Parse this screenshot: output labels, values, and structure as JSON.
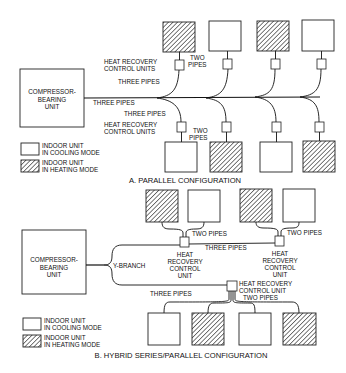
{
  "diagram_a": {
    "caption": "A. PARALLEL CONFIGURATION",
    "compressor": [
      "COMPRESSOR-",
      "BEARING",
      "UNIT"
    ],
    "labels": {
      "hr_top": [
        "HEAT RECOVERY",
        "CONTROL UNITS"
      ],
      "hr_bottom": [
        "HEAT RECOVERY",
        "CONTROL UNITS"
      ],
      "two_pipes_top": [
        "TWO",
        "PIPES"
      ],
      "two_pipes_bottom": [
        "TWO",
        "PIPES"
      ],
      "three_pipes_top": "THREE PIPES",
      "three_pipes_main": "THREE PIPES",
      "three_pipes_bottom": "THREE PIPES"
    },
    "top_units": [
      "heating",
      "cooling",
      "heating",
      "cooling"
    ],
    "bottom_units": [
      "cooling",
      "heating",
      "cooling",
      "heating"
    ],
    "legend": {
      "cooling": [
        "INDOOR UNIT",
        "IN COOLING MODE"
      ],
      "heating": [
        "INDOOR UNIT",
        "IN HEATING MODE"
      ]
    }
  },
  "diagram_b": {
    "caption": "B. HYBRID SERIES/PARALLEL CONFIGURATION",
    "compressor": [
      "COMPRESSOR-",
      "BEARING",
      "UNIT"
    ],
    "labels": {
      "y_branch": "Y-BRANCH",
      "two_pipes_1": "TWO PIPES",
      "two_pipes_2": "TWO PIPES",
      "two_pipes_3": "TWO PIPES",
      "three_pipes_upper": "THREE PIPES",
      "three_pipes_lower": "THREE PIPES",
      "hr_1": [
        "HEAT",
        "RECOVERY",
        "CONTROL",
        "UNIT"
      ],
      "hr_2": [
        "HEAT",
        "RECOVERY",
        "CONTROL",
        "UNIT"
      ],
      "hr_3": [
        "HEAT RECOVERY",
        "CONTROL UNIT"
      ]
    },
    "top_units": [
      "heating",
      "cooling",
      "heating",
      "cooling"
    ],
    "bottom_units": [
      "cooling",
      "heating",
      "cooling",
      "heating"
    ],
    "legend": {
      "cooling": [
        "INDOOR UNIT",
        "IN COOLING MODE"
      ],
      "heating": [
        "INDOOR UNIT",
        "IN HEATING MODE"
      ]
    }
  }
}
